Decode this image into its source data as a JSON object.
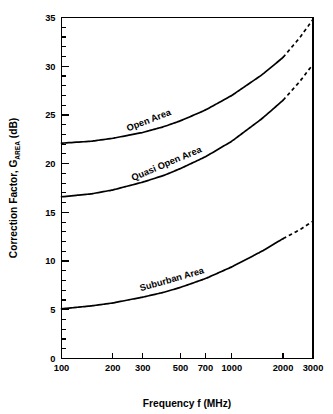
{
  "chart_data": {
    "type": "line",
    "title": "",
    "xlabel": "Frequency f (MHz)",
    "ylabel": "Correction Factor, GAREA (dB)",
    "ylabel_main": "Correction Factor, G",
    "ylabel_sub": "AREA",
    "ylabel_units": " (dB)",
    "xscale": "log",
    "yscale": "linear",
    "xlim": [
      100,
      3000
    ],
    "ylim": [
      0,
      35
    ],
    "grid": false,
    "legend_position": "inline-curve-labels",
    "xticks": [
      100,
      200,
      300,
      500,
      700,
      1000,
      2000,
      3000
    ],
    "xticklabels": [
      "100",
      "200",
      "300",
      "500",
      "700",
      "1000",
      "2000",
      "3000"
    ],
    "yticks": [
      0,
      5,
      10,
      15,
      20,
      25,
      30,
      35
    ],
    "yticklabels": [
      "0",
      "5",
      "10",
      "15",
      "20",
      "25",
      "30",
      "35"
    ],
    "yminorticks": [
      1,
      2,
      3,
      4,
      6,
      7,
      8,
      9,
      11,
      12,
      13,
      14,
      16,
      17,
      18,
      19,
      21,
      22,
      23,
      24,
      26,
      27,
      28,
      29,
      31,
      32,
      33,
      34
    ],
    "series": [
      {
        "name": "Open Area",
        "label": "Open Area",
        "color": "#000000",
        "solid_to": 2000,
        "x": [
          100,
          150,
          200,
          300,
          400,
          500,
          700,
          1000,
          1500,
          2000,
          2500,
          3000
        ],
        "values": [
          22.1,
          22.3,
          22.6,
          23.2,
          23.8,
          24.4,
          25.5,
          27.0,
          29.1,
          30.9,
          32.9,
          34.8
        ]
      },
      {
        "name": "Quasi Open Area",
        "label": "Quasi Open Area",
        "color": "#000000",
        "solid_to": 2000,
        "x": [
          100,
          150,
          200,
          300,
          400,
          500,
          700,
          1000,
          1500,
          2000,
          2500,
          3000
        ],
        "values": [
          16.6,
          16.9,
          17.3,
          18.1,
          18.8,
          19.5,
          20.7,
          22.3,
          24.6,
          26.5,
          28.4,
          30.2
        ]
      },
      {
        "name": "Suburban Area",
        "label": "Suburban Area",
        "color": "#000000",
        "solid_to": 2000,
        "x": [
          100,
          150,
          200,
          300,
          400,
          500,
          700,
          1000,
          1500,
          2000,
          2500,
          3000
        ],
        "values": [
          5.1,
          5.4,
          5.7,
          6.3,
          6.8,
          7.3,
          8.2,
          9.4,
          11.0,
          12.3,
          13.2,
          14.1
        ]
      }
    ]
  }
}
